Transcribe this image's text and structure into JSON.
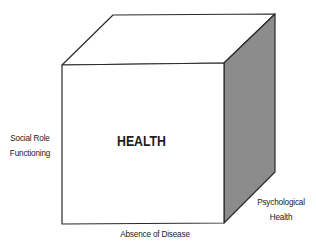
{
  "diagram": {
    "type": "cube",
    "center_label": "HEALTH",
    "axes": {
      "left": {
        "line1": "Social Role",
        "line2": "Functioning"
      },
      "bottom": {
        "line1": "Absence of Disease"
      },
      "right": {
        "line1": "Psychological",
        "line2": "Health"
      }
    },
    "colors": {
      "front_face": "#ffffff",
      "top_face": "#ffffff",
      "side_face": "#8c8c8c",
      "stroke": "#2a2a2a"
    }
  }
}
